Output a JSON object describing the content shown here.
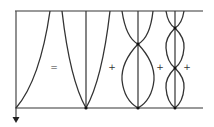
{
  "diagram": {
    "colors": {
      "line": "#333333",
      "frame": "#777777",
      "background": "#ffffff"
    },
    "operators": [
      {
        "symbol": "=",
        "x": 54,
        "y": 67
      },
      {
        "symbol": "+",
        "x": 112,
        "y": 67
      },
      {
        "symbol": "+",
        "x": 160,
        "y": 67
      },
      {
        "symbol": "+",
        "x": 187,
        "y": 67
      }
    ],
    "panels": [
      {
        "name": "initial-shape",
        "type": "half-parabola"
      },
      {
        "name": "mode-1",
        "type": "parabola",
        "nodes": 0
      },
      {
        "name": "mode-2",
        "type": "lens",
        "nodes": 1
      },
      {
        "name": "mode-3",
        "type": "lens",
        "nodes": 2
      }
    ],
    "axis": {
      "direction": "down",
      "icon": "arrow-down-icon"
    }
  }
}
